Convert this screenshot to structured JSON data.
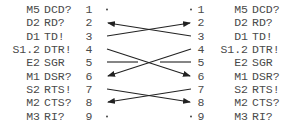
{
  "left": {
    "pins": [
      {
        "code": "M5",
        "signal": "DCD?",
        "num": "1"
      },
      {
        "code": "D2",
        "signal": "RD?",
        "num": "2"
      },
      {
        "code": "D1",
        "signal": "TD!",
        "num": "3"
      },
      {
        "code": "S1.2",
        "signal": "DTR!",
        "num": "4"
      },
      {
        "code": "E2",
        "signal": "SGR",
        "num": "5"
      },
      {
        "code": "M1",
        "signal": "DSR?",
        "num": "6"
      },
      {
        "code": "S2",
        "signal": "RTS!",
        "num": "7"
      },
      {
        "code": "M2",
        "signal": "CTS?",
        "num": "8"
      },
      {
        "code": "M3",
        "signal": "RI?",
        "num": "9"
      }
    ]
  },
  "right": {
    "pins": [
      {
        "code": "M5",
        "signal": "DCD?",
        "num": "1"
      },
      {
        "code": "D2",
        "signal": "RD?",
        "num": "2"
      },
      {
        "code": "D1",
        "signal": "TD!",
        "num": "3"
      },
      {
        "code": "S1.2",
        "signal": "DTR!",
        "num": "4"
      },
      {
        "code": "E2",
        "signal": "SGR",
        "num": "5"
      },
      {
        "code": "M1",
        "signal": "DSR?",
        "num": "6"
      },
      {
        "code": "S2",
        "signal": "RTS!",
        "num": "7"
      },
      {
        "code": "M2",
        "signal": "CTS?",
        "num": "8"
      },
      {
        "code": "M3",
        "signal": "RI?",
        "num": "9"
      }
    ]
  },
  "connections": [
    {
      "from": "right-3",
      "to": "left-2",
      "arrow": "left"
    },
    {
      "from": "left-3",
      "to": "right-2",
      "arrow": "right"
    },
    {
      "from": "left-4",
      "to": "right-6",
      "arrow": "right"
    },
    {
      "from": "right-4",
      "to": "left-6",
      "arrow": "left"
    },
    {
      "from": "left-5",
      "to": "stub",
      "arrow": "none"
    },
    {
      "from": "right-5",
      "to": "stub",
      "arrow": "none"
    },
    {
      "from": "left-7",
      "to": "right-8",
      "arrow": "right"
    },
    {
      "from": "right-7",
      "to": "left-8",
      "arrow": "left"
    }
  ],
  "colors": {
    "text": "#4a4a4a",
    "line": "#222222",
    "background": "#ffffff"
  }
}
